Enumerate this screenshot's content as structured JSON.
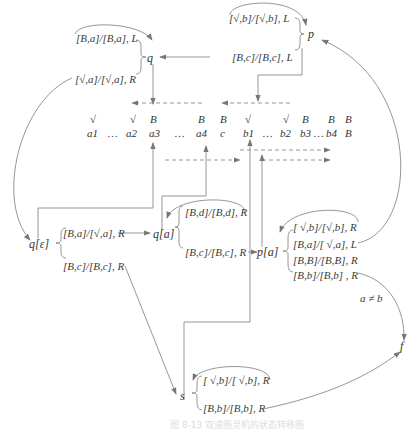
{
  "states": {
    "q": "q",
    "p": "p",
    "q_eps": "q[ε]",
    "q_a": "q[a]",
    "p_a": "p[a]",
    "s": "s",
    "f": "f"
  },
  "transitions": {
    "q_loop": "[B,a]/[B,a], L",
    "q_out": "[√,a]/[√,a], R",
    "p_loop": "[√,b]/[√,b], L",
    "p_out": "[B,c]/[B,c], L",
    "q_eps_to_qa": "[B,a]/[√,a], R",
    "q_eps_to_s": "[B,c]/[B,c], R",
    "qa_loop": "[B,d]/[B,d], R",
    "qa_to_pa": "[B,c]/[B,c], R",
    "pa_loop": "[ √,b]/[√,b], R",
    "pa_to_p": "[B,a]/[ √,a], L",
    "pa_BB": "[B,B]/[B,B], R",
    "pa_to_f": "[B,b]/[B,b] , R",
    "s_loop": "[ √,b]/[ √,b], R",
    "s_to_f": "[B,b]/[B,b], R"
  },
  "condition": "a ≠ b",
  "tape": {
    "track1": [
      "√",
      "√",
      "B",
      "B",
      "B",
      "√",
      "√",
      "B",
      "B",
      "B"
    ],
    "track2": [
      "a1",
      "…",
      "a2",
      "a3",
      "…",
      "a4",
      "c",
      "b1",
      "…",
      "b2",
      "b3",
      "…",
      "b4",
      "B"
    ]
  },
  "caption": "图 8-13 双道图灵机的状态转移图",
  "colors": {
    "line": "#7a7a7a",
    "text": "#333333"
  }
}
